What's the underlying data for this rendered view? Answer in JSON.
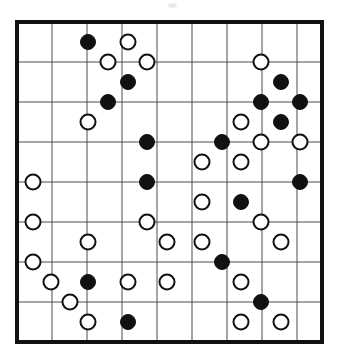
{
  "figure": {
    "kind": "go-board-diagram",
    "title": "",
    "background_color": "#ffffff",
    "border_color": "#111111",
    "grid_line_color": "#4d4d4d",
    "black_stone_color": "#111111",
    "white_stone_fill": "#ffffff",
    "white_stone_edge": "#111111",
    "board_border_width_px": 4,
    "grid_line_width_px": 1,
    "stone_radius_px": 7.5
  },
  "board": {
    "columns": 9,
    "rows": 9,
    "column_x": [
      17,
      52,
      87,
      122,
      157,
      192,
      227,
      262,
      297
    ],
    "row_y": [
      22,
      62,
      102,
      142,
      182,
      222,
      262,
      302,
      342
    ],
    "right_edge_x": 322,
    "bottom_edge_y": 342,
    "left_edge_x": 17,
    "top_edge_y": 22
  },
  "stones": [
    {
      "id": "s1",
      "color": "black",
      "x": 88,
      "y": 42
    },
    {
      "id": "s2",
      "color": "white",
      "x": 128,
      "y": 42
    },
    {
      "id": "s3",
      "color": "white",
      "x": 108,
      "y": 62
    },
    {
      "id": "s4",
      "color": "white",
      "x": 147,
      "y": 62
    },
    {
      "id": "s5",
      "color": "white",
      "x": 261,
      "y": 62
    },
    {
      "id": "s6",
      "color": "black",
      "x": 128,
      "y": 82
    },
    {
      "id": "s7",
      "color": "black",
      "x": 281,
      "y": 82
    },
    {
      "id": "s8",
      "color": "black",
      "x": 108,
      "y": 102
    },
    {
      "id": "s9",
      "color": "black",
      "x": 261,
      "y": 102
    },
    {
      "id": "s10",
      "color": "black",
      "x": 300,
      "y": 102
    },
    {
      "id": "s11",
      "color": "white",
      "x": 88,
      "y": 122
    },
    {
      "id": "s12",
      "color": "white",
      "x": 241,
      "y": 122
    },
    {
      "id": "s13",
      "color": "black",
      "x": 281,
      "y": 122
    },
    {
      "id": "s14",
      "color": "black",
      "x": 147,
      "y": 142
    },
    {
      "id": "s15",
      "color": "black",
      "x": 222,
      "y": 142
    },
    {
      "id": "s16",
      "color": "white",
      "x": 261,
      "y": 142
    },
    {
      "id": "s17",
      "color": "white",
      "x": 300,
      "y": 142
    },
    {
      "id": "s18",
      "color": "white",
      "x": 202,
      "y": 162
    },
    {
      "id": "s19",
      "color": "white",
      "x": 241,
      "y": 162
    },
    {
      "id": "s20",
      "color": "white",
      "x": 33,
      "y": 182
    },
    {
      "id": "s21",
      "color": "black",
      "x": 147,
      "y": 182
    },
    {
      "id": "s22",
      "color": "black",
      "x": 300,
      "y": 182
    },
    {
      "id": "s23",
      "color": "white",
      "x": 202,
      "y": 202
    },
    {
      "id": "s24",
      "color": "black",
      "x": 241,
      "y": 202
    },
    {
      "id": "s25",
      "color": "white",
      "x": 33,
      "y": 222
    },
    {
      "id": "s26",
      "color": "white",
      "x": 147,
      "y": 222
    },
    {
      "id": "s27",
      "color": "white",
      "x": 261,
      "y": 222
    },
    {
      "id": "s28",
      "color": "white",
      "x": 88,
      "y": 242
    },
    {
      "id": "s29",
      "color": "white",
      "x": 167,
      "y": 242
    },
    {
      "id": "s30",
      "color": "white",
      "x": 202,
      "y": 242
    },
    {
      "id": "s31",
      "color": "white",
      "x": 281,
      "y": 242
    },
    {
      "id": "s32",
      "color": "white",
      "x": 33,
      "y": 262
    },
    {
      "id": "s33",
      "color": "black",
      "x": 222,
      "y": 262
    },
    {
      "id": "s34",
      "color": "white",
      "x": 51,
      "y": 282
    },
    {
      "id": "s35",
      "color": "black",
      "x": 88,
      "y": 282
    },
    {
      "id": "s36",
      "color": "white",
      "x": 128,
      "y": 282
    },
    {
      "id": "s37",
      "color": "white",
      "x": 167,
      "y": 282
    },
    {
      "id": "s38",
      "color": "white",
      "x": 241,
      "y": 282
    },
    {
      "id": "s39",
      "color": "white",
      "x": 70,
      "y": 302
    },
    {
      "id": "s40",
      "color": "black",
      "x": 261,
      "y": 302
    },
    {
      "id": "s41",
      "color": "white",
      "x": 88,
      "y": 322
    },
    {
      "id": "s42",
      "color": "black",
      "x": 128,
      "y": 322
    },
    {
      "id": "s43",
      "color": "white",
      "x": 241,
      "y": 322
    },
    {
      "id": "s44",
      "color": "white",
      "x": 281,
      "y": 322
    }
  ],
  "counts": {
    "black_stones": 16,
    "white_stones": 28,
    "total_stones": 44
  }
}
